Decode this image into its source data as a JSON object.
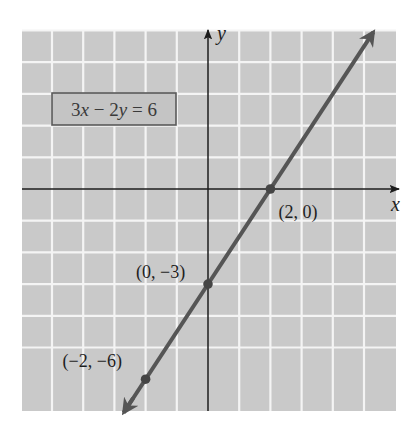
{
  "chart_data": {
    "type": "line",
    "title": "",
    "equation": "3x − 2y = 6",
    "equation_parts": {
      "a": "3",
      "x": "x",
      "op": " − ",
      "b": "2",
      "y": "y",
      "rhs": " = 6"
    },
    "xlabel": "x",
    "ylabel": "y",
    "xlim": [
      -6,
      6
    ],
    "ylim": [
      -6,
      6
    ],
    "grid": true,
    "grid_step": 1,
    "tick_labels": false,
    "series": [
      {
        "name": "3x − 2y = 6",
        "slope": 1.5,
        "intercept": -3,
        "x_start": -2.7,
        "x_end": 5.3,
        "arrows": "both"
      }
    ],
    "points": [
      {
        "x": 2,
        "y": 0,
        "label": "(2, 0)"
      },
      {
        "x": 0,
        "y": -3,
        "label": "(0, −3)"
      },
      {
        "x": -2,
        "y": -6,
        "label": "(−2, −6)"
      }
    ]
  },
  "style": {
    "background": "#ffffff",
    "grid_fill": "#c9c9c9",
    "grid_line": "#f4f4f4",
    "axis_color": "#1c1c1c",
    "line_color": "#555555",
    "point_color": "#454545",
    "equation_box_fill": "#c4c4c4",
    "equation_box_border": "#5a5a5a"
  },
  "layout": {
    "origin_px": [
      208,
      189
    ],
    "unit_px_x": 31.2,
    "unit_px_y": 31.7,
    "plot_left": 22,
    "plot_top": 30,
    "plot_right": 396,
    "plot_bottom": 411,
    "equation_box": {
      "x": 52,
      "y": 93,
      "w": 124,
      "h": 32
    },
    "point_label_offsets": [
      [
        8,
        29
      ],
      [
        -72,
        -6
      ],
      [
        -83,
        -12
      ]
    ]
  }
}
